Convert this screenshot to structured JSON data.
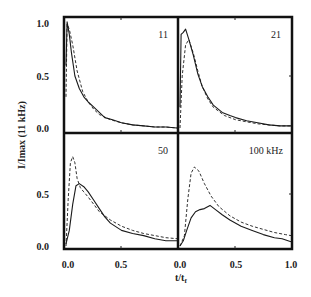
{
  "chart_data": {
    "type": "line",
    "layout": "2x2 panels, shared axes",
    "ylabel": "I/Imax (11 kHz)",
    "xlabel": "t/t_f",
    "xlim": [
      0.0,
      1.0
    ],
    "ylim": [
      0.0,
      1.0
    ],
    "x_ticks": [
      "0.0",
      "0.5",
      "1.0"
    ],
    "x_ticks_left_panel": [
      "0.0",
      "0.5"
    ],
    "y_ticks_top": [
      "0.0",
      "0.5",
      "1.0"
    ],
    "y_ticks_bottom": [
      "0.0",
      "0.5"
    ],
    "grid": false,
    "legend": null,
    "panels": [
      {
        "label": "11",
        "position": "top-left",
        "series": [
          {
            "name": "solid (measured)",
            "style": "solid",
            "x": [
              0.0,
              0.01,
              0.03,
              0.05,
              0.08,
              0.12,
              0.16,
              0.2,
              0.25,
              0.3,
              0.35,
              0.42,
              0.5,
              0.6,
              0.7,
              0.8,
              0.9,
              1.0
            ],
            "y": [
              0.6,
              1.02,
              0.9,
              0.72,
              0.5,
              0.38,
              0.3,
              0.25,
              0.2,
              0.15,
              0.1,
              0.08,
              0.05,
              0.03,
              0.02,
              0.01,
              0.01,
              0.0
            ]
          },
          {
            "name": "dashed (model)",
            "style": "dashed",
            "x": [
              0.0,
              0.01,
              0.03,
              0.06,
              0.1,
              0.15,
              0.2,
              0.25,
              0.3,
              0.4,
              0.5,
              0.6,
              0.7,
              0.8,
              0.9,
              1.0
            ],
            "y": [
              0.3,
              1.0,
              0.95,
              0.8,
              0.55,
              0.35,
              0.25,
              0.18,
              0.13,
              0.08,
              0.05,
              0.03,
              0.02,
              0.01,
              0.01,
              0.0
            ]
          }
        ]
      },
      {
        "label": "21",
        "position": "top-right",
        "series": [
          {
            "name": "solid (measured)",
            "style": "solid",
            "x": [
              0.0,
              0.01,
              0.03,
              0.05,
              0.08,
              0.12,
              0.16,
              0.2,
              0.25,
              0.3,
              0.38,
              0.45,
              0.5,
              0.6,
              0.7,
              0.8,
              0.9,
              1.0
            ],
            "y": [
              0.2,
              0.9,
              0.92,
              0.95,
              0.85,
              0.7,
              0.52,
              0.4,
              0.3,
              0.22,
              0.15,
              0.12,
              0.1,
              0.07,
              0.05,
              0.03,
              0.02,
              0.02
            ]
          },
          {
            "name": "dashed (model)",
            "style": "dashed",
            "x": [
              0.0,
              0.02,
              0.05,
              0.08,
              0.12,
              0.16,
              0.2,
              0.25,
              0.3,
              0.4,
              0.5,
              0.6,
              0.7,
              0.8,
              0.9,
              1.0
            ],
            "y": [
              0.0,
              0.5,
              0.8,
              0.85,
              0.72,
              0.55,
              0.4,
              0.28,
              0.2,
              0.12,
              0.08,
              0.06,
              0.04,
              0.03,
              0.02,
              0.02
            ]
          }
        ]
      },
      {
        "label": "50",
        "position": "bottom-left",
        "series": [
          {
            "name": "solid (measured)",
            "style": "solid",
            "x": [
              0.0,
              0.03,
              0.06,
              0.09,
              0.12,
              0.16,
              0.2,
              0.25,
              0.3,
              0.35,
              0.4,
              0.5,
              0.6,
              0.7,
              0.8,
              0.9,
              1.0
            ],
            "y": [
              0.02,
              0.15,
              0.4,
              0.58,
              0.6,
              0.57,
              0.52,
              0.44,
              0.36,
              0.28,
              0.22,
              0.15,
              0.12,
              0.1,
              0.07,
              0.05,
              0.05
            ]
          },
          {
            "name": "dashed (model)",
            "style": "dashed",
            "x": [
              0.0,
              0.02,
              0.04,
              0.06,
              0.08,
              0.1,
              0.13,
              0.16,
              0.2,
              0.25,
              0.3,
              0.4,
              0.5,
              0.6,
              0.7,
              0.8,
              0.9,
              1.0
            ],
            "y": [
              0.0,
              0.45,
              0.8,
              0.86,
              0.8,
              0.65,
              0.56,
              0.52,
              0.47,
              0.4,
              0.33,
              0.25,
              0.19,
              0.15,
              0.12,
              0.1,
              0.08,
              0.07
            ]
          }
        ]
      },
      {
        "label": "100 kHz",
        "position": "bottom-right",
        "series": [
          {
            "name": "solid (measured)",
            "style": "solid",
            "x": [
              0.0,
              0.03,
              0.06,
              0.1,
              0.14,
              0.18,
              0.22,
              0.27,
              0.32,
              0.38,
              0.45,
              0.55,
              0.65,
              0.75,
              0.85,
              0.92,
              1.0
            ],
            "y": [
              0.0,
              0.05,
              0.15,
              0.27,
              0.33,
              0.35,
              0.36,
              0.39,
              0.35,
              0.3,
              0.25,
              0.19,
              0.15,
              0.11,
              0.08,
              0.07,
              0.04
            ]
          },
          {
            "name": "dashed (model)",
            "style": "dashed",
            "x": [
              0.0,
              0.04,
              0.07,
              0.1,
              0.13,
              0.17,
              0.22,
              0.28,
              0.35,
              0.45,
              0.55,
              0.65,
              0.75,
              0.85,
              0.95,
              1.0
            ],
            "y": [
              0.0,
              0.1,
              0.45,
              0.7,
              0.76,
              0.72,
              0.6,
              0.48,
              0.38,
              0.29,
              0.23,
              0.19,
              0.16,
              0.13,
              0.11,
              0.1
            ]
          }
        ]
      }
    ]
  },
  "axes": {
    "ylabel": "I/Imax (11 kHz)",
    "xlabel_main": "t/t",
    "xlabel_sub": "f",
    "tick_y_top_1": "1.0",
    "tick_y_top_05": "0.5",
    "tick_y_top_0": "0.0",
    "tick_y_bot_05": "0.5",
    "tick_y_bot_0": "0.0",
    "tick_x_l_0": "0.0",
    "tick_x_l_05": "0.5",
    "tick_x_r_0": "0.0",
    "tick_x_r_05": "0.5",
    "tick_x_r_1": "1.0"
  },
  "panel_labels": {
    "p11": "11",
    "p21": "21",
    "p50": "50",
    "p100": "100 kHz"
  },
  "colors": {
    "line": "#1a1a1a",
    "frame": "#111111"
  }
}
